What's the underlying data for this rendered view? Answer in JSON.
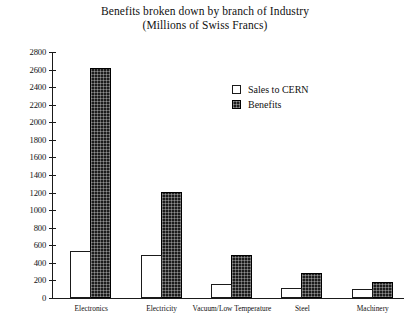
{
  "chart_data": {
    "type": "bar",
    "title": "Benefits broken down by branch of Industry",
    "subtitle": "(Millions of Swiss Francs)",
    "title_lines": [
      "Benefits broken down by branch of Industry",
      "(Millions of Swiss Francs)"
    ],
    "xlabel": "",
    "ylabel": "",
    "ylim": [
      0,
      2800
    ],
    "ytick_step": 200,
    "grid": false,
    "legend_position": "upper right",
    "categories": [
      "Electronics",
      "Electricity",
      "Vacuum/Low Temperature",
      "Steel",
      "Machinery"
    ],
    "yticks": [
      "0",
      "200",
      "400",
      "600",
      "800",
      "1000",
      "1200",
      "1400",
      "1600",
      "1800",
      "2000",
      "2200",
      "2400",
      "2600",
      "2800"
    ],
    "series": [
      {
        "name": "Sales to CERN",
        "color": "#ffffff",
        "edge_color": "#1a1a1a",
        "values": [
          540,
          490,
          160,
          110,
          100
        ]
      },
      {
        "name": "Benefits",
        "color": "#1c1c1c",
        "edge_color": "#000000",
        "values": [
          2620,
          1210,
          490,
          280,
          180
        ]
      }
    ]
  },
  "legend": {
    "items": [
      {
        "label": "Sales to CERN"
      },
      {
        "label": "Benefits"
      }
    ]
  }
}
